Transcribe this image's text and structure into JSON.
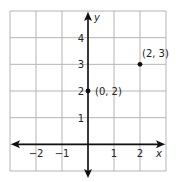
{
  "chart_data": {
    "type": "scatter",
    "title": "",
    "xlabel": "x",
    "ylabel": "y",
    "xlim": [
      -3,
      3
    ],
    "ylim": [
      -1,
      5
    ],
    "grid": true,
    "x_ticks": [
      -2,
      -1,
      1,
      2
    ],
    "x_tick_labels": [
      "−2",
      "−1",
      "1",
      "2"
    ],
    "y_ticks": [
      1,
      2,
      3,
      4
    ],
    "y_tick_labels": [
      "1",
      "2",
      "3",
      "4"
    ],
    "points": [
      {
        "x": 0,
        "y": 2,
        "label": "(0, 2)"
      },
      {
        "x": 2,
        "y": 3,
        "label": "(2, 3)"
      }
    ]
  },
  "colors": {
    "grid": "#b5b5b5",
    "axis": "#111111",
    "point": "#111111"
  }
}
